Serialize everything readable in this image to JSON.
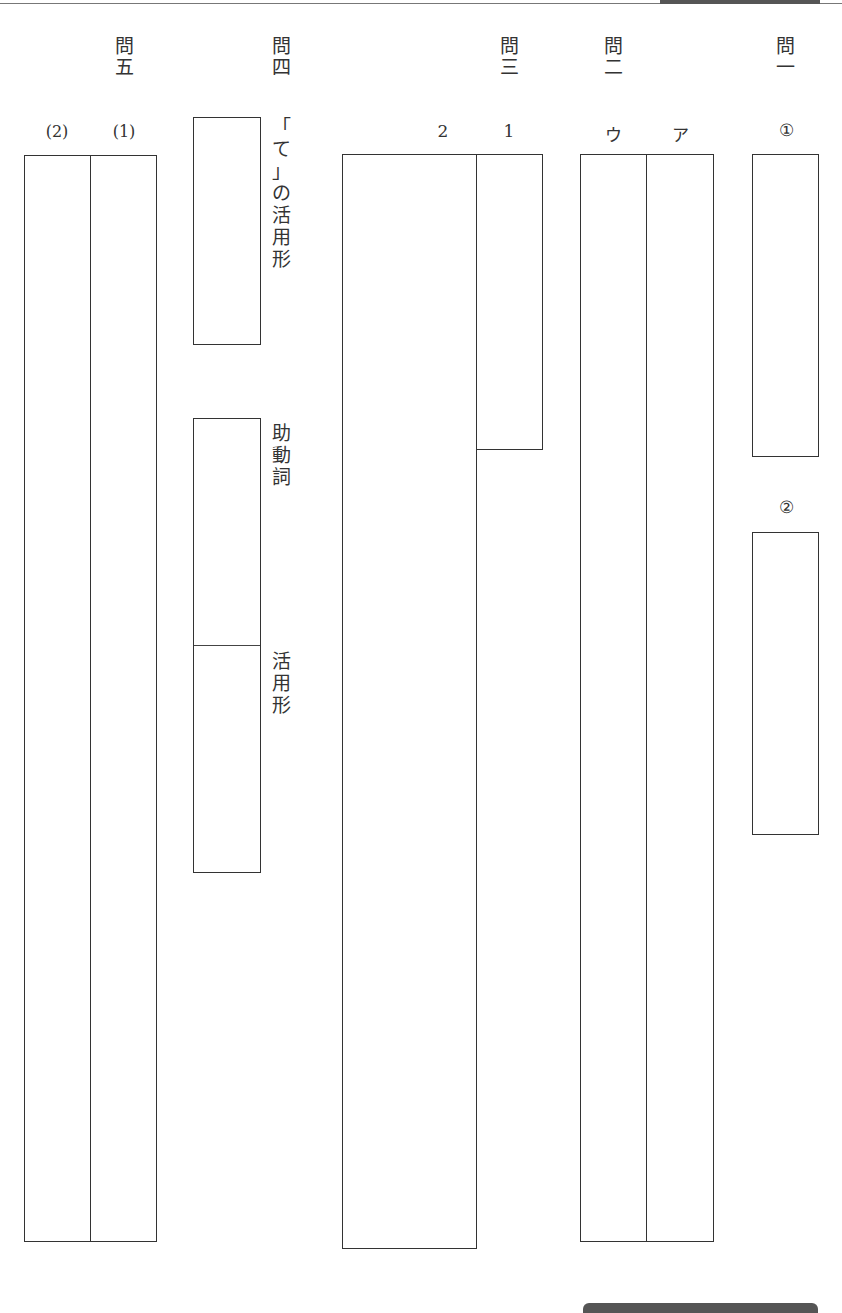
{
  "questions": {
    "q1": {
      "title_top": "問",
      "title_bottom": "一",
      "sub": {
        "a": "①",
        "b": "②"
      }
    },
    "q2": {
      "title_top": "問",
      "title_bottom": "二",
      "sub": {
        "a": "ア",
        "c": "ウ"
      }
    },
    "q3": {
      "title_top": "問",
      "title_bottom": "三",
      "sub": {
        "one": "1",
        "two": "2"
      }
    },
    "q4": {
      "title_top": "問",
      "title_bottom": "四",
      "label_te": [
        "「",
        "て",
        "」",
        "の",
        "活",
        "用",
        "形"
      ],
      "label_jodoushi": [
        "助",
        "動",
        "詞"
      ],
      "label_katsuyoukei": [
        "活",
        "用",
        "形"
      ]
    },
    "q5": {
      "title_top": "問",
      "title_bottom": "五",
      "sub": {
        "one": "(1)",
        "two": "(2)"
      }
    }
  }
}
